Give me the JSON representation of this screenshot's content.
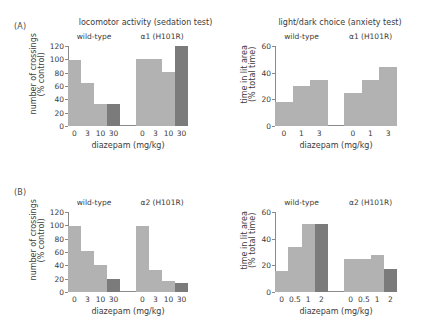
{
  "figure": {
    "panels": [
      {
        "label": "(A)",
        "charts": [
          {
            "title": "locomotor activity (sedation test)",
            "ylabel_line1": "number of crossings",
            "ylabel_line2": "(% control)",
            "xlabel": "diazepam (mg/kg)",
            "yticks": [
              "0",
              "20",
              "40",
              "60",
              "80",
              "100",
              "120"
            ],
            "groups": [
              {
                "name": "wild-type",
                "categories": [
                  "0",
                  "3",
                  "10",
                  "30"
                ],
                "values": [
                  99,
                  65,
                  33,
                  33
                ],
                "shades": [
                  "light",
                  "light",
                  "light",
                  "dark"
                ]
              },
              {
                "name": "α1 (H101R)",
                "categories": [
                  "0",
                  "3",
                  "10",
                  "30"
                ],
                "values": [
                  100,
                  100,
                  81,
                  120
                ],
                "shades": [
                  "light",
                  "light",
                  "light",
                  "dark"
                ]
              }
            ]
          },
          {
            "title": "light/dark choice (anxiety test)",
            "ylabel_line1": "time in lit area",
            "ylabel_line2": "(% total time)",
            "xlabel": "diazepam (mg/kg)",
            "yticks": [
              "0",
              "20",
              "40",
              "60"
            ],
            "groups": [
              {
                "name": "wild-type",
                "categories": [
                  "0",
                  "1",
                  "3"
                ],
                "values": [
                  18,
                  30,
                  34.5
                ],
                "shades": [
                  "light",
                  "light",
                  "light"
                ]
              },
              {
                "name": "α1 (H101R)",
                "categories": [
                  "0",
                  "1",
                  "3"
                ],
                "values": [
                  25,
                  34.5,
                  44.5
                ],
                "shades": [
                  "light",
                  "light",
                  "light"
                ]
              }
            ]
          }
        ]
      },
      {
        "label": "(B)",
        "charts": [
          {
            "title": "",
            "ylabel_line1": "number of crossings",
            "ylabel_line2": "(% control)",
            "xlabel": "diazepam (mg/kg)",
            "yticks": [
              "0",
              "20",
              "40",
              "60",
              "80",
              "100",
              "120"
            ],
            "groups": [
              {
                "name": "wild-type",
                "categories": [
                  "0",
                  "3",
                  "10",
                  "30"
                ],
                "values": [
                  99,
                  61,
                  40,
                  20
                ],
                "shades": [
                  "light",
                  "light",
                  "light",
                  "dark"
                ]
              },
              {
                "name": "α2 (H101R)",
                "categories": [
                  "0",
                  "3",
                  "10",
                  "30"
                ],
                "values": [
                  99,
                  33,
                  16,
                  13
                ],
                "shades": [
                  "light",
                  "light",
                  "light",
                  "dark"
                ]
              }
            ]
          },
          {
            "title": "",
            "ylabel_line1": "time in lit area",
            "ylabel_line2": "(% total time)",
            "xlabel": "diazepam (mg/kg)",
            "yticks": [
              "0",
              "20",
              "40",
              "60"
            ],
            "groups": [
              {
                "name": "wild-type",
                "categories": [
                  "0",
                  "0.5",
                  "1",
                  "2"
                ],
                "values": [
                  16,
                  33.5,
                  51,
                  51
                ],
                "shades": [
                  "light",
                  "light",
                  "light",
                  "dark"
                ]
              },
              {
                "name": "α2 (H101R)",
                "categories": [
                  "0",
                  "0.5",
                  "1",
                  "2"
                ],
                "values": [
                  25,
                  25,
                  28,
                  17
                ],
                "shades": [
                  "light",
                  "light",
                  "light",
                  "dark"
                ]
              }
            ]
          }
        ]
      }
    ]
  },
  "colors": {
    "bar_light": "#b2b2b2",
    "bar_dark": "#7b7b7b",
    "axis": "#8a8a8a",
    "text": "#3b3b3b",
    "background": "#ffffff"
  },
  "chart_data": [
    {
      "type": "bar",
      "panel": "(A)",
      "title": "locomotor activity (sedation test)",
      "xlabel": "diazepam (mg/kg)",
      "ylabel": "number of crossings (% control)",
      "ylim": [
        0,
        120
      ],
      "categories": [
        "0",
        "3",
        "10",
        "30"
      ],
      "series": [
        {
          "name": "wild-type",
          "values": [
            99,
            65,
            33,
            33
          ]
        },
        {
          "name": "α1 (H101R)",
          "values": [
            100,
            100,
            81,
            120
          ]
        }
      ],
      "grid": false,
      "legend": "none",
      "note": "highest dose (30 mg/kg) bar drawn in darker gray"
    },
    {
      "type": "bar",
      "panel": "(A)",
      "title": "light/dark choice (anxiety test)",
      "xlabel": "diazepam (mg/kg)",
      "ylabel": "time in lit area (% total time)",
      "ylim": [
        0,
        60
      ],
      "categories": [
        "0",
        "1",
        "3"
      ],
      "series": [
        {
          "name": "wild-type",
          "values": [
            18,
            30,
            34.5
          ]
        },
        {
          "name": "α1 (H101R)",
          "values": [
            25,
            34.5,
            44.5
          ]
        }
      ],
      "grid": false,
      "legend": "none"
    },
    {
      "type": "bar",
      "panel": "(B)",
      "title": "locomotor activity (sedation test)",
      "xlabel": "diazepam (mg/kg)",
      "ylabel": "number of crossings (% control)",
      "ylim": [
        0,
        120
      ],
      "categories": [
        "0",
        "3",
        "10",
        "30"
      ],
      "series": [
        {
          "name": "wild-type",
          "values": [
            99,
            61,
            40,
            20
          ]
        },
        {
          "name": "α2 (H101R)",
          "values": [
            99,
            33,
            16,
            13
          ]
        }
      ],
      "grid": false,
      "legend": "none",
      "note": "highest dose (30 mg/kg) bar drawn in darker gray"
    },
    {
      "type": "bar",
      "panel": "(B)",
      "title": "light/dark choice (anxiety test)",
      "xlabel": "diazepam (mg/kg)",
      "ylabel": "time in lit area (% total time)",
      "ylim": [
        0,
        60
      ],
      "categories": [
        "0",
        "0.5",
        "1",
        "2"
      ],
      "series": [
        {
          "name": "wild-type",
          "values": [
            16,
            33.5,
            51,
            51
          ]
        },
        {
          "name": "α2 (H101R)",
          "values": [
            25,
            25,
            28,
            17
          ]
        }
      ],
      "grid": false,
      "legend": "none",
      "note": "highest dose (2 mg/kg) bar drawn in darker gray"
    }
  ]
}
